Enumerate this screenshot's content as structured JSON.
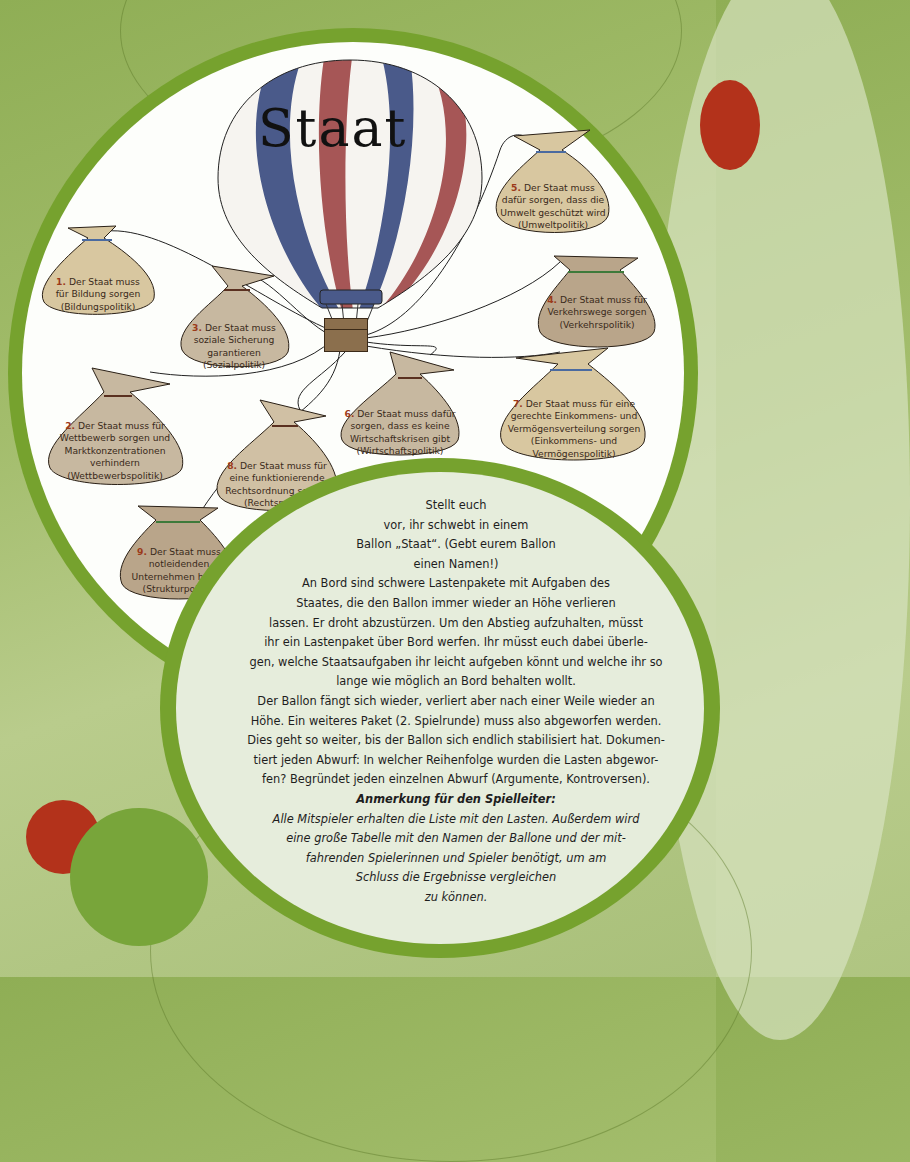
{
  "balloon": {
    "title": "Staat",
    "stripe_colors": {
      "blue": "#4a5a8a",
      "red": "#a65656",
      "white": "#f6f4f0"
    }
  },
  "sacks": [
    {
      "number": "1.",
      "lines": [
        "Der Staat muss",
        "für Bildung sorgen",
        "(Bildungspolitik)"
      ]
    },
    {
      "number": "2.",
      "lines": [
        "Der Staat muss für",
        "Wettbewerb sorgen und",
        "Marktkonzentrationen",
        "verhindern",
        "(Wettbewerbspolitik)"
      ]
    },
    {
      "number": "3.",
      "lines": [
        "Der Staat muss",
        "soziale Sicherung",
        "garantieren",
        "(Sozialpolitik)"
      ]
    },
    {
      "number": "4.",
      "lines": [
        "Der Staat muss für",
        "Verkehrswege sorgen",
        "(Verkehrspolitik)"
      ]
    },
    {
      "number": "5.",
      "lines": [
        "Der Staat muss",
        "dafür sorgen, dass die",
        "Umwelt geschützt wird",
        "(Umweltpolitik)"
      ]
    },
    {
      "number": "6.",
      "lines": [
        "Der Staat muss dafür",
        "sorgen, dass es keine",
        "Wirtschaftskrisen gibt",
        "(Wirtschaftspolitik)"
      ]
    },
    {
      "number": "7.",
      "lines": [
        "Der Staat muss für eine",
        "gerechte Einkommens- und",
        "Vermögensverteilung sorgen",
        "(Einkommens- und",
        "Vermögenspolitik)"
      ]
    },
    {
      "number": "8.",
      "lines": [
        "Der Staat muss für",
        "eine funktionierende",
        "Rechtsordnung sorgen",
        "(Rechtspolitik)"
      ]
    },
    {
      "number": "9.",
      "lines": [
        "Der Staat muss",
        "notleidenden",
        "Unternehmen helfen",
        "(Strukturpolitik)"
      ]
    }
  ],
  "instructions": {
    "lines": [
      "Stellt euch",
      "vor, ihr schwebt in einem",
      "Ballon „Staat“. (Gebt eurem Ballon",
      "einen Namen!)",
      "An Bord sind schwere Lastenpakete mit Aufgaben des",
      "Staates, die den Ballon immer wieder an Höhe verlieren",
      "lassen. Er droht abzustürzen. Um den Abstieg aufzuhalten, müsst",
      "ihr ein Lastenpaket über Bord werfen. Ihr müsst euch dabei überle-",
      "gen, welche Staatsaufgaben ihr leicht aufgeben könnt und welche ihr so",
      "lange wie möglich an Bord behalten wollt.",
      "Der Ballon fängt sich wieder, verliert aber nach einer Weile wieder an",
      "Höhe. Ein weiteres Paket (2. Spielrunde) muss also abgeworfen werden.",
      "Dies geht so weiter, bis der Ballon sich endlich stabilisiert hat. Dokumen-",
      "tiert jeden Abwurf: In welcher Reihenfolge wurden die Lasten abgewor-",
      "fen? Begründet jeden einzelnen Abwurf (Argumente, Kontroversen)."
    ],
    "note_title": "Anmerkung für den Spielleiter:",
    "note_lines": [
      "Alle Mitspieler erhalten die Liste mit den Lasten. Außerdem wird",
      "eine große Tabelle mit den Namen der Ballone und der mit-",
      "fahrenden Spielerinnen und Spieler benötigt, um am",
      "Schluss die Ergebnisse vergleichen",
      "zu können."
    ]
  },
  "colors": {
    "background_green": "#a3bd6c",
    "ring_green": "#76a22e",
    "accent_red": "#b3321b",
    "sack_light": "#d8c7a0",
    "sack_dark": "#b9a58a"
  }
}
